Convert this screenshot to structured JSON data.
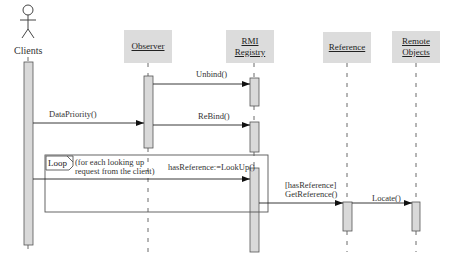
{
  "diagram": {
    "type": "UML sequence diagram",
    "actor": {
      "label": "Clients",
      "icon": "stick-figure-icon"
    },
    "objects": [
      {
        "id": "observer",
        "label": "Observer"
      },
      {
        "id": "rmi",
        "label_line1": "RMI",
        "label_line2": "Registry"
      },
      {
        "id": "reference",
        "label": "Reference"
      },
      {
        "id": "remote",
        "label_line1": "Remote",
        "label_line2": "Objects"
      }
    ],
    "messages": [
      {
        "id": "unbind",
        "label": "Unbind()",
        "from": "Observer",
        "to": "RMI Registry"
      },
      {
        "id": "datapriority",
        "label": "DataPriority()",
        "from": "Clients",
        "to": "Observer"
      },
      {
        "id": "rebind",
        "label": "ReBind()",
        "from": "Observer",
        "to": "RMI Registry"
      },
      {
        "id": "lookup",
        "label": "hasReference:=LookUp()",
        "from": "Clients",
        "to": "RMI Registry"
      },
      {
        "id": "getreference",
        "label_line1": "[hasReference]",
        "label_line2": "GetReference()",
        "from": "RMI Registry",
        "to": "Reference"
      },
      {
        "id": "locate",
        "label": "Locate()",
        "from": "Reference",
        "to": "Remote Objects"
      }
    ],
    "loop": {
      "tag": "Loop",
      "guard_line1": "(for each looking up",
      "guard_line2": "request from the client)"
    },
    "colors": {
      "box_fill": "#dcdcdc",
      "activation_fill": "#d9d9d9",
      "line": "#333333"
    }
  }
}
